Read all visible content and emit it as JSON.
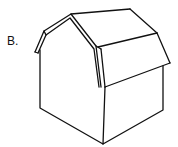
{
  "figure": {
    "label": "B.",
    "stroke_color": "#111111",
    "background_color": "#ffffff"
  }
}
